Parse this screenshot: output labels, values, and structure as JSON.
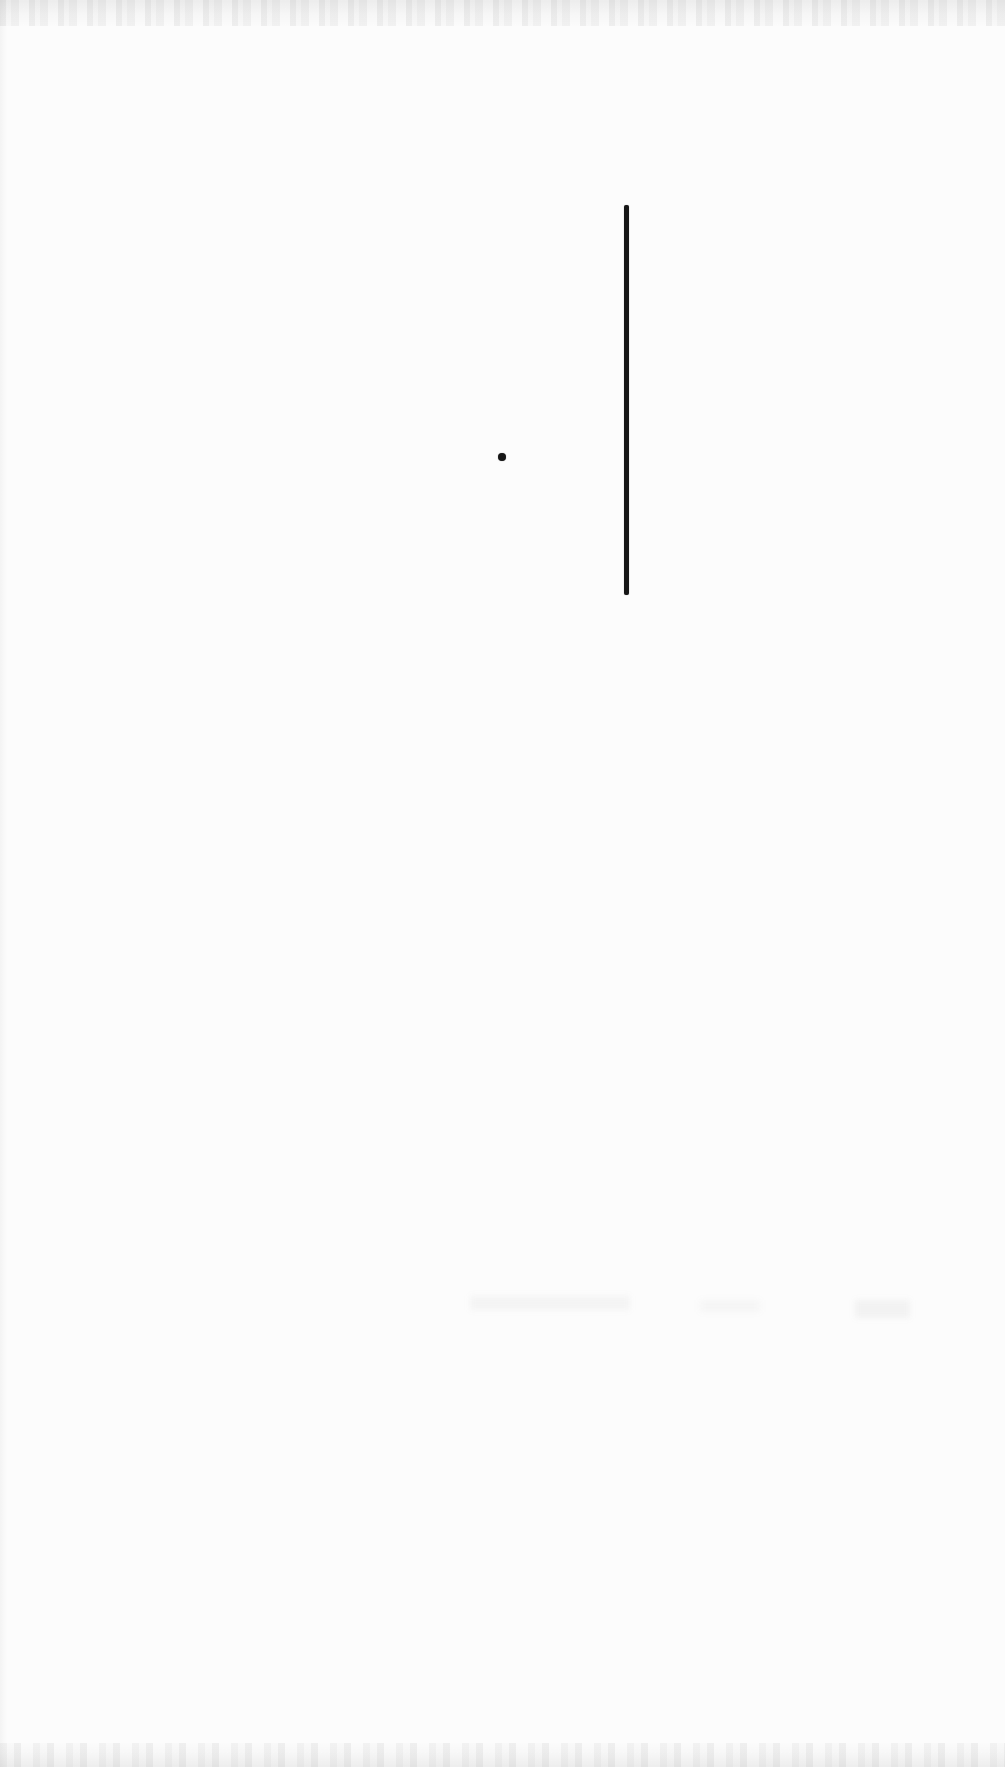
{
  "page": {
    "paper_color": "#fcfcfc",
    "ink_color": "#161616",
    "width": 1005,
    "height": 1767
  },
  "marks": [
    {
      "type": "vertical-line",
      "name": "vertical-rule-mark",
      "x": 624,
      "y": 205,
      "width": 5,
      "height": 390,
      "color": "#161616"
    },
    {
      "type": "dot",
      "name": "ink-dot",
      "cx": 502,
      "cy": 457,
      "diameter": 8,
      "color": "#161616"
    }
  ],
  "bleed_smudges": [
    {
      "x": 470,
      "y": 1296,
      "width": 160,
      "height": 14,
      "color": "rgba(120,120,120,0.06)"
    },
    {
      "x": 700,
      "y": 1300,
      "width": 60,
      "height": 12,
      "color": "rgba(120,120,120,0.05)"
    },
    {
      "x": 855,
      "y": 1300,
      "width": 55,
      "height": 18,
      "color": "rgba(110,110,110,0.07)"
    }
  ],
  "artifacts": {
    "top_edge_band_height": 26,
    "bottom_edge_band_height": 24,
    "left_edge_strip_width": 8
  }
}
